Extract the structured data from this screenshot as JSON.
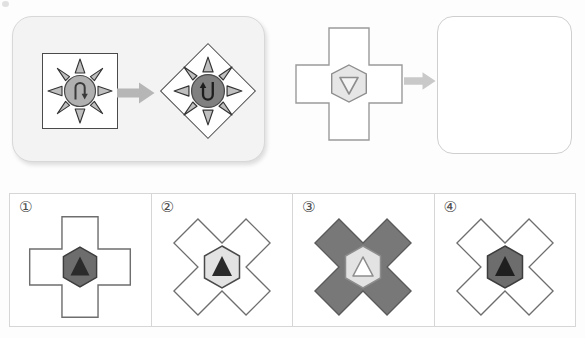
{
  "puzzle": {
    "type": "visual-analogy-multiple-choice",
    "example": {
      "source": {
        "frame_shape": "square",
        "frame_fill": "#ffffff",
        "frame_stroke": "#4a4a4a",
        "burst_rays": 8,
        "burst_fill": "#bfbfbf",
        "burst_stroke": "#333333",
        "circle_fill": "#b0b0b0",
        "circle_stroke": "#4a4a4a",
        "inner_symbol": "hook-arrow-up",
        "inner_symbol_rotation_deg": 0
      },
      "arrow": {
        "icon": "right-arrow-icon",
        "color": "#b6b6b6"
      },
      "target": {
        "frame_shape": "diamond",
        "frame_fill": "#ffffff",
        "frame_stroke": "#4a4a4a",
        "burst_rays": 8,
        "burst_fill": "#bfbfbf",
        "burst_stroke": "#333333",
        "circle_fill": "#808080",
        "circle_stroke": "#4a4a4a",
        "inner_symbol": "hook-arrow-down",
        "inner_symbol_rotation_deg": 180
      }
    },
    "question": {
      "figure": {
        "outer_shape": "plus-cross",
        "outer_rotation_deg": 0,
        "outer_fill": "#ffffff",
        "outer_stroke": "#9a9a9a",
        "inner_shape": "hexagon",
        "inner_fill": "#e6e6e6",
        "inner_stroke": "#8d8d8d",
        "symbol": "triangle-outline-down",
        "symbol_fill": "#f2f2f2",
        "symbol_stroke": "#8d8d8d"
      },
      "arrow": {
        "icon": "right-arrow-icon",
        "color": "#cccccc"
      },
      "answer_placeholder": {
        "shape": "rounded-square",
        "fill": "#ffffff",
        "stroke": "#cfcfcf",
        "label": ""
      }
    },
    "options": [
      {
        "label": "①",
        "number": 1,
        "outer_shape": "plus-cross",
        "outer_rotation_deg": 0,
        "outer_fill": "#ffffff",
        "outer_stroke": "#6e6e6e",
        "inner_shape": "hexagon",
        "inner_fill": "#6d6d6d",
        "inner_stroke": "#3d3d3d",
        "symbol": "triangle-solid-up",
        "symbol_fill": "#2b2b2b"
      },
      {
        "label": "②",
        "number": 2,
        "outer_shape": "plus-cross",
        "outer_rotation_deg": 45,
        "outer_fill": "#ffffff",
        "outer_stroke": "#6e6e6e",
        "inner_shape": "hexagon",
        "inner_fill": "#e3e3e3",
        "inner_stroke": "#4a4a4a",
        "symbol": "triangle-solid-up",
        "symbol_fill": "#2b2b2b"
      },
      {
        "label": "③",
        "number": 3,
        "outer_shape": "plus-cross",
        "outer_rotation_deg": 45,
        "outer_fill": "#787878",
        "outer_stroke": "#5a5a5a",
        "inner_shape": "hexagon",
        "inner_fill": "#e3e3e3",
        "inner_stroke": "#8d8d8d",
        "symbol": "triangle-outline-up",
        "symbol_fill": "#ffffff",
        "symbol_stroke": "#8d8d8d"
      },
      {
        "label": "④",
        "number": 4,
        "outer_shape": "plus-cross",
        "outer_rotation_deg": 45,
        "outer_fill": "#ffffff",
        "outer_stroke": "#6e6e6e",
        "inner_shape": "hexagon",
        "inner_fill": "#6d6d6d",
        "inner_stroke": "#3d3d3d",
        "symbol": "triangle-solid-up",
        "symbol_fill": "#1f1f1f"
      }
    ]
  },
  "colors": {
    "page_background": "#fdfdfd",
    "panel_background": "#f3f3f3",
    "panel_border": "#d8d8d8",
    "grid_border": "#d6d6d6",
    "arrow_gray": "#b6b6b6",
    "dark_stroke": "#4a4a4a"
  }
}
